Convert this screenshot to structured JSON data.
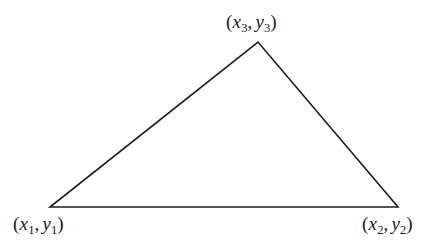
{
  "figure": {
    "type": "triangle-diagram",
    "background_color": "#ffffff",
    "stroke_color": "#1c1c1c",
    "stroke_width": 1.6,
    "width": 448,
    "height": 248,
    "vertices": [
      {
        "id": "v1",
        "x": 50,
        "y": 207,
        "label_role": "bottom-left"
      },
      {
        "id": "v2",
        "x": 398,
        "y": 207,
        "label_role": "bottom-right"
      },
      {
        "id": "v3",
        "x": 258,
        "y": 42,
        "label_role": "apex"
      }
    ],
    "edges": [
      {
        "from": "v1",
        "to": "v3"
      },
      {
        "from": "v3",
        "to": "v2"
      },
      {
        "from": "v2",
        "to": "v1"
      }
    ]
  },
  "labels": {
    "v1": {
      "open": "(",
      "x_var": "x",
      "x_sub": "1",
      "comma": ",",
      "y_var": "y",
      "y_sub": "1",
      "close": ")",
      "plain": "(x1, y1)"
    },
    "v2": {
      "open": "(",
      "x_var": "x",
      "x_sub": "2",
      "comma": ",",
      "y_var": "y",
      "y_sub": "2",
      "close": ")",
      "plain": "(x2, y2)"
    },
    "v3": {
      "open": "(",
      "x_var": "x",
      "x_sub": "3",
      "comma": ",",
      "y_var": "y",
      "y_sub": "3",
      "close": ")",
      "plain": "(x3, y3)"
    }
  }
}
